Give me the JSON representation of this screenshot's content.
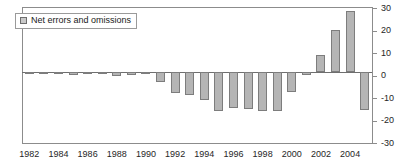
{
  "chart_data": {
    "type": "bar",
    "title": "",
    "xlabel": "",
    "ylabel": "",
    "ylim": [
      -30,
      30
    ],
    "yticks": [
      30,
      20,
      10,
      0,
      -10,
      -20,
      -30
    ],
    "ytick_labels": [
      "30",
      "20",
      "10",
      "0",
      "-10",
      "-20",
      "-30"
    ],
    "grid": false,
    "legend_position": "top-left",
    "legend": [
      "Net errors and omissions"
    ],
    "series_name": "Net errors and omissions",
    "bar_color": "#b5b5b5",
    "bar_border_color": "#7d7d7d",
    "categories": [
      "1982",
      "1983",
      "1984",
      "1985",
      "1986",
      "1987",
      "1988",
      "1989",
      "1990",
      "1991",
      "1992",
      "1993",
      "1994",
      "1995",
      "1996",
      "1997",
      "1998",
      "1999",
      "2000",
      "2001",
      "2002",
      "2003",
      "2004",
      "2005"
    ],
    "values": [
      -0.5,
      -0.4,
      -0.6,
      -1.2,
      -0.7,
      -0.9,
      -1.8,
      -1.2,
      -0.8,
      -4.5,
      -9.5,
      -10.0,
      -12.5,
      -17.5,
      -16.0,
      -16.5,
      -17.5,
      -17.5,
      -9.0,
      -1.5,
      7.5,
      18.5,
      27.0,
      -17.0
    ],
    "xtick_labels": [
      "1982",
      "1984",
      "1986",
      "1988",
      "1990",
      "1992",
      "1994",
      "1996",
      "1998",
      "2000",
      "2002",
      "2004"
    ],
    "xtick_years": [
      1982,
      1984,
      1986,
      1988,
      1990,
      1992,
      1994,
      1996,
      1998,
      2000,
      2002,
      2004
    ]
  }
}
